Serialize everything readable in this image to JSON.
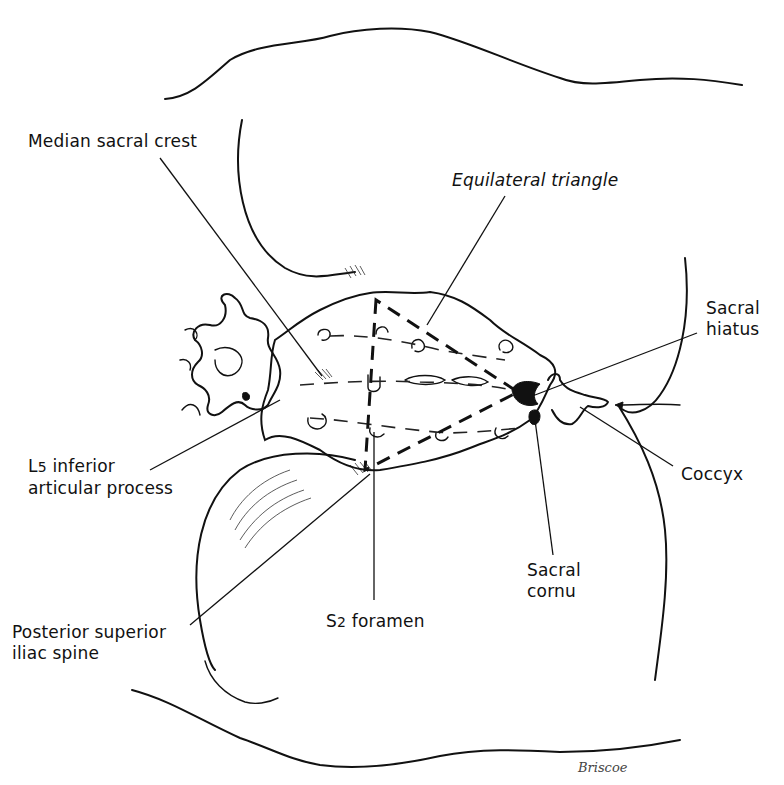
{
  "figure": {
    "labels": {
      "median_sacral_crest": "Median sacral crest",
      "equilateral_triangle": "Equilateral triangle",
      "sacral_hiatus_line1": "Sacral",
      "sacral_hiatus_line2": "hiatus",
      "l5_line1_prefix": "L",
      "l5_line1_sub": "5",
      "l5_line1_rest": " inferior",
      "l5_line2": "articular process",
      "coccyx": "Coccyx",
      "sacral_cornu_line1": "Sacral",
      "sacral_cornu_line2": "cornu",
      "s2_prefix": "S",
      "s2_sub": "2",
      "s2_rest": "  foramen",
      "psis_line1": "Posterior superior",
      "psis_line2": "iliac spine"
    },
    "signature": "Briscoe"
  }
}
